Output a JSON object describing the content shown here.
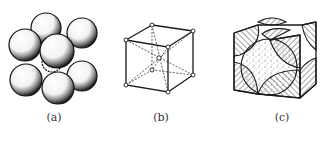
{
  "figure": {
    "panels": [
      {
        "id": "a",
        "label": "(a)",
        "description": "hard-sphere model of body-centered cubic packing"
      },
      {
        "id": "b",
        "label": "(b)",
        "description": "body-centered cubic lattice unit cell (skeleton)"
      },
      {
        "id": "c",
        "label": "(c)",
        "description": "unit cell showing atom sections within the cube"
      }
    ]
  },
  "colors": {
    "ink": "#1a1a1a",
    "background": "#ffffff"
  }
}
